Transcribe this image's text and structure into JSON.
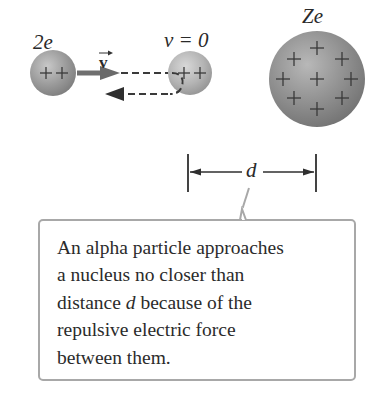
{
  "figure": {
    "alpha_particle": {
      "charge_label": "2e",
      "charge_symbols": "+ +"
    },
    "velocity_label": "v",
    "stopped_particle": {
      "velocity_label": "v = 0",
      "charge_symbols": "+ +"
    },
    "nucleus": {
      "charge_label": "Ze",
      "plus_count": 9
    },
    "distance": {
      "label": "d"
    }
  },
  "callout": {
    "line1": "An alpha particle approaches",
    "line2": "a nucleus no closer than",
    "line3_pre": "distance ",
    "line3_var": "d",
    "line3_post": " because of the",
    "line4": "repulsive electric force",
    "line5": "between them."
  },
  "colors": {
    "sphere_small": "#9a9a9a",
    "sphere_large": "#8c8c8c",
    "arrow": "#6a6a6a",
    "callout_border": "#a8a8a8",
    "text": "#2b2b2b"
  }
}
